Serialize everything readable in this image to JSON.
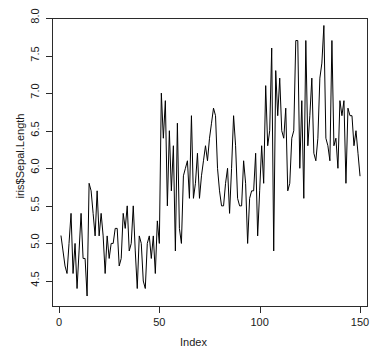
{
  "chart_data": {
    "type": "line",
    "title": "",
    "xlabel": "Index",
    "ylabel": "iris$Sepal.Length",
    "xlim": [
      0,
      151
    ],
    "ylim": [
      4.3,
      7.9
    ],
    "xticks": [
      0,
      50,
      100,
      150
    ],
    "xticklabels": [
      "0",
      "50",
      "100",
      "150"
    ],
    "yticks": [
      4.5,
      5.0,
      5.5,
      6.0,
      6.5,
      7.0,
      7.5,
      8.0
    ],
    "yticklabels": [
      "4.5",
      "5.0",
      "5.5",
      "6.0",
      "6.5",
      "7.0",
      "7.5",
      "8.0"
    ],
    "grid": false,
    "legend": false,
    "line_color": "#000000",
    "background_color": "#ffffff",
    "axis_color": "#2b2b2b",
    "series": [
      {
        "name": "iris$Sepal.Length",
        "x": [
          1,
          2,
          3,
          4,
          5,
          6,
          7,
          8,
          9,
          10,
          11,
          12,
          13,
          14,
          15,
          16,
          17,
          18,
          19,
          20,
          21,
          22,
          23,
          24,
          25,
          26,
          27,
          28,
          29,
          30,
          31,
          32,
          33,
          34,
          35,
          36,
          37,
          38,
          39,
          40,
          41,
          42,
          43,
          44,
          45,
          46,
          47,
          48,
          49,
          50,
          51,
          52,
          53,
          54,
          55,
          56,
          57,
          58,
          59,
          60,
          61,
          62,
          63,
          64,
          65,
          66,
          67,
          68,
          69,
          70,
          71,
          72,
          73,
          74,
          75,
          76,
          77,
          78,
          79,
          80,
          81,
          82,
          83,
          84,
          85,
          86,
          87,
          88,
          89,
          90,
          91,
          92,
          93,
          94,
          95,
          96,
          97,
          98,
          99,
          100,
          101,
          102,
          103,
          104,
          105,
          106,
          107,
          108,
          109,
          110,
          111,
          112,
          113,
          114,
          115,
          116,
          117,
          118,
          119,
          120,
          121,
          122,
          123,
          124,
          125,
          126,
          127,
          128,
          129,
          130,
          131,
          132,
          133,
          134,
          135,
          136,
          137,
          138,
          139,
          140,
          141,
          142,
          143,
          144,
          145,
          146,
          147,
          148,
          149,
          150
        ],
        "values": [
          5.1,
          4.9,
          4.7,
          4.6,
          5.0,
          5.4,
          4.6,
          5.0,
          4.4,
          4.9,
          5.4,
          4.8,
          4.8,
          4.3,
          5.8,
          5.7,
          5.4,
          5.1,
          5.7,
          5.1,
          5.4,
          5.1,
          4.6,
          5.1,
          4.8,
          5.0,
          5.0,
          5.2,
          5.2,
          4.7,
          4.8,
          5.4,
          5.2,
          5.5,
          4.9,
          5.0,
          5.5,
          4.9,
          4.4,
          5.1,
          5.0,
          4.5,
          4.4,
          5.0,
          5.1,
          4.8,
          5.1,
          4.6,
          5.3,
          5.0,
          7.0,
          6.4,
          6.9,
          5.5,
          6.5,
          5.7,
          6.3,
          4.9,
          6.6,
          5.2,
          5.0,
          5.9,
          6.0,
          6.1,
          5.6,
          6.7,
          5.6,
          5.8,
          6.2,
          5.6,
          5.9,
          6.1,
          6.3,
          6.1,
          6.4,
          6.6,
          6.8,
          6.7,
          6.0,
          5.7,
          5.5,
          5.5,
          5.8,
          6.0,
          5.4,
          6.0,
          6.7,
          6.3,
          5.6,
          5.5,
          5.5,
          6.1,
          5.8,
          5.0,
          5.6,
          5.7,
          5.7,
          6.2,
          5.1,
          5.7,
          6.3,
          5.8,
          7.1,
          6.3,
          6.5,
          7.6,
          4.9,
          7.3,
          6.7,
          7.2,
          6.5,
          6.4,
          6.8,
          5.7,
          5.8,
          6.4,
          6.5,
          7.7,
          7.7,
          6.0,
          6.9,
          5.6,
          7.7,
          6.3,
          6.7,
          7.2,
          6.2,
          6.1,
          6.4,
          7.2,
          7.4,
          7.9,
          6.4,
          6.3,
          6.1,
          7.7,
          6.3,
          6.4,
          6.0,
          6.9,
          6.7,
          6.9,
          5.8,
          6.8,
          6.7,
          6.7,
          6.3,
          6.5,
          6.2,
          5.9
        ]
      }
    ]
  },
  "axis": {
    "ylabel": "iris$Sepal.Length",
    "xlabel": "Index"
  }
}
